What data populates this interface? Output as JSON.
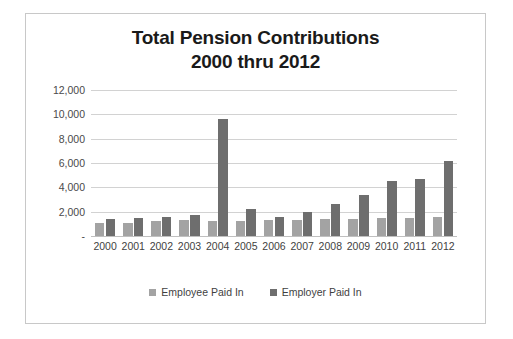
{
  "frame": {
    "border_color": "#c8c8c8",
    "background": "#ffffff"
  },
  "chart_data": {
    "type": "bar",
    "title": "Total Pension Contributions 2000 thru 2012",
    "title_lines": [
      "Total Pension Contributions",
      "2000 thru 2012"
    ],
    "xlabel": "",
    "ylabel": "",
    "ylim": [
      0,
      12000
    ],
    "ytick_step": 2000,
    "ytick_labels": [
      "12,000",
      "10,000",
      "8,000",
      "6,000",
      "4,000",
      "2,000",
      "-"
    ],
    "ytick_values": [
      12000,
      10000,
      8000,
      6000,
      4000,
      2000,
      0
    ],
    "grid": true,
    "grid_axis": "y",
    "legend_position": "bottom",
    "categories": [
      "2000",
      "2001",
      "2002",
      "2003",
      "2004",
      "2005",
      "2006",
      "2007",
      "2008",
      "2009",
      "2010",
      "2011",
      "2012"
    ],
    "series": [
      {
        "name": "Employee Paid In",
        "color": "#a3a3a3",
        "values": [
          1050,
          1100,
          1200,
          1280,
          1270,
          1260,
          1300,
          1350,
          1400,
          1430,
          1470,
          1490,
          1550
        ]
      },
      {
        "name": "Employer Paid In",
        "color": "#6e6e6e",
        "values": [
          1400,
          1480,
          1570,
          1730,
          9600,
          2250,
          1600,
          2000,
          2650,
          3350,
          4550,
          4650,
          6170
        ]
      }
    ]
  },
  "legend": {
    "items": [
      {
        "label": "Employee Paid In",
        "color": "#a3a3a3"
      },
      {
        "label": "Employer Paid In",
        "color": "#6e6e6e"
      }
    ]
  }
}
